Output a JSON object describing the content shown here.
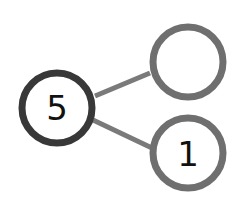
{
  "diagram": {
    "type": "number-bond",
    "whole": {
      "label": "5",
      "cx": 57,
      "cy": 108,
      "r": 35,
      "stroke": "#383838",
      "stroke_width": 7
    },
    "parts": [
      {
        "label": "",
        "cx": 188,
        "cy": 62,
        "r": 35,
        "stroke": "#6f6f6f",
        "stroke_width": 7
      },
      {
        "label": "1",
        "cx": 188,
        "cy": 153,
        "r": 35,
        "stroke": "#6f6f6f",
        "stroke_width": 7
      }
    ],
    "connector_color": "#7a7a7a",
    "connector_width": 5
  }
}
